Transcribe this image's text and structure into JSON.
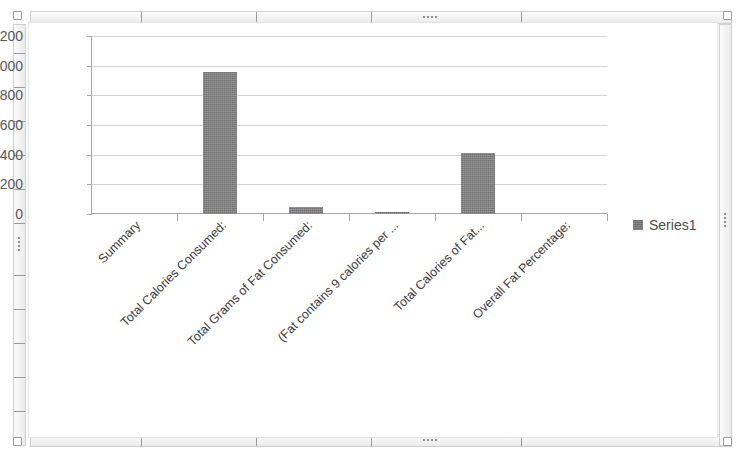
{
  "chart_data": {
    "type": "bar",
    "title": "",
    "xlabel": "",
    "ylabel": "",
    "ylim": [
      0,
      1200
    ],
    "ytick_values": [
      0,
      200,
      400,
      600,
      800,
      1000,
      1200
    ],
    "ytick_labels": [
      "0",
      "200",
      "400",
      "600",
      "800",
      "1000",
      "1200"
    ],
    "grid": true,
    "legend_position": "right",
    "categories": [
      "Summary",
      "Total Calories Consumed:",
      "Total Grams of Fat Consumed:",
      "(Fat contains 9 calories per ...",
      "Total Calories of Fat...",
      "Overall Fat Percentage:"
    ],
    "series": [
      {
        "name": "Series1",
        "values": [
          0,
          955,
          50,
          15,
          410,
          0
        ]
      }
    ],
    "colors": {
      "bar": "#6f6f6f",
      "gridline": "#d3d3d3",
      "axis": "#a6a6a6",
      "tick_text": "#595959",
      "label_text": "#3a3a3a",
      "canvas": "#ffffff",
      "frame": "#cfcfcf"
    }
  },
  "legend": {
    "entries": [
      {
        "label": "Series1",
        "swatch": "legend-swatch"
      }
    ]
  },
  "frame": {
    "name": "chart-object-frame",
    "selected": true
  }
}
